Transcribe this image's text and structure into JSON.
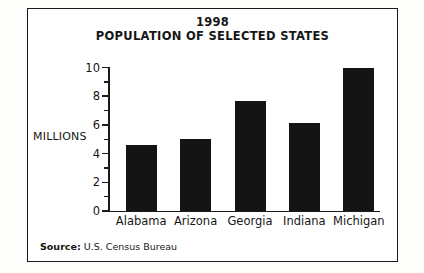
{
  "figure": {
    "title_line1": "1998",
    "title_line2": "POPULATION OF SELECTED STATES",
    "y_axis_title": "MILLIONS",
    "source_label": "Source:",
    "source_text": "U.S. Census Bureau",
    "frame_color": "#1a1a1a",
    "bar_color": "#141414",
    "background_color": "#ffffff"
  },
  "chart_data": {
    "type": "bar",
    "title": "1998 POPULATION OF SELECTED STATES",
    "subtitle": "",
    "xlabel": "",
    "ylabel": "MILLIONS",
    "categories": [
      "Alabama",
      "Arizona",
      "Georgia",
      "Indiana",
      "Michigan"
    ],
    "values": [
      4.6,
      5.0,
      7.65,
      6.15,
      10.0
    ],
    "ylim": [
      0,
      10
    ],
    "y_major_ticks": [
      0,
      2,
      4,
      6,
      8,
      10
    ],
    "y_major_tick_labels": [
      "0",
      "2",
      "4",
      "6",
      "8",
      "10"
    ],
    "y_minor_ticks": [
      1,
      3,
      5,
      7,
      9
    ],
    "grid": false,
    "legend": false,
    "legend_position": "none",
    "annotations": [
      "Source: U.S. Census Bureau"
    ]
  }
}
